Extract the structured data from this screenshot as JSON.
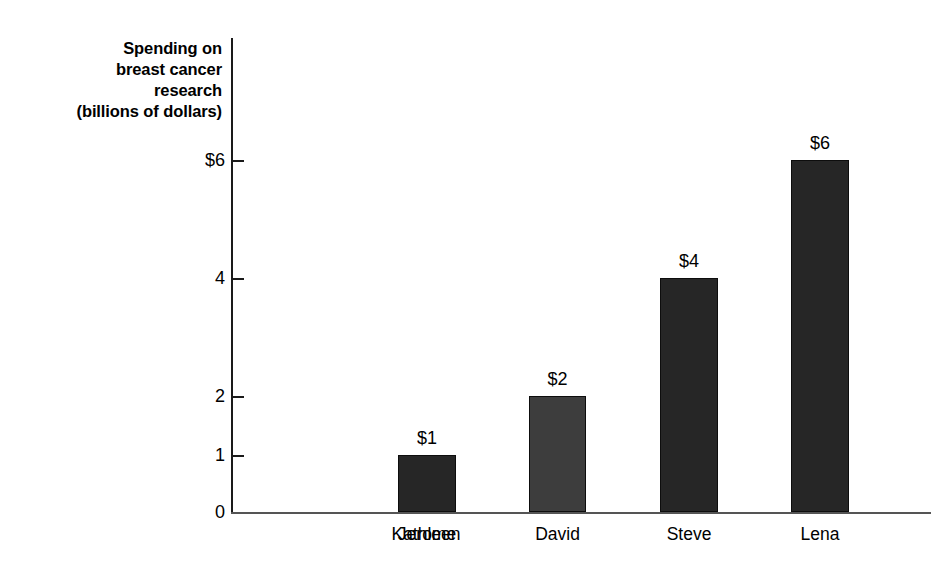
{
  "chart_data": {
    "type": "bar",
    "title": "",
    "subtitle": "",
    "xlabel": "",
    "ylabel": "Spending on breast cancer research (billions of dollars)",
    "ylabel_lines": [
      "Spending on",
      "breast cancer",
      "research",
      "(billions of dollars)"
    ],
    "categories": [
      "Kathleen",
      "Jerome",
      "David",
      "Steve",
      "Lena"
    ],
    "values": [
      0,
      1,
      2,
      4,
      6
    ],
    "value_labels": [
      "$0",
      "$1",
      "$2",
      "$4",
      "$6"
    ],
    "ytick_values": [
      0,
      1,
      2,
      4,
      6
    ],
    "ytick_labels": [
      "0",
      "1",
      "2",
      "4",
      "6"
    ],
    "ytick_labels_display": [
      "0",
      "1",
      "2",
      "4",
      "$6"
    ],
    "ylim": [
      0,
      6
    ],
    "grid": false,
    "legend": null
  },
  "style": {
    "background": "#ffffff",
    "axis_color": "#1a1a1a",
    "baseline_color": "#555555",
    "text_color": "#000000",
    "bar_default_color": "#262626",
    "bar_highlight_color": "#3d3d3d"
  },
  "bars": [
    {
      "category": "Kathleen",
      "value": 0,
      "label": "$0",
      "color": "#262626",
      "left_px": 166,
      "width_px": 58,
      "top_px": 474,
      "height_px": 0
    },
    {
      "category": "Jerome",
      "value": 1,
      "label": "$1",
      "color": "#262626",
      "left_px": 167,
      "width_px": 58,
      "top_px": 417,
      "height_px": 57
    },
    {
      "category": "David",
      "value": 2,
      "label": "$2",
      "color": "#3d3d3d",
      "left_px": 298,
      "width_px": 57,
      "top_px": 358,
      "height_px": 116
    },
    {
      "category": "Steve",
      "value": 4,
      "label": "$4",
      "color": "#262626",
      "left_px": 429,
      "width_px": 58,
      "top_px": 240,
      "height_px": 234
    },
    {
      "category": "Lena",
      "value": 6,
      "label": "$6",
      "color": "#262626",
      "left_px": 560,
      "width_px": 58,
      "top_px": 122,
      "height_px": 352
    }
  ],
  "yticks": [
    {
      "label": "$6",
      "value": 6,
      "top_px": 160
    },
    {
      "label": "4",
      "value": 4,
      "top_px": 278
    },
    {
      "label": "2",
      "value": 2,
      "top_px": 396
    },
    {
      "label": "1",
      "value": 1,
      "top_px": 455
    },
    {
      "label": "0",
      "value": 0,
      "top_px": 512
    }
  ]
}
